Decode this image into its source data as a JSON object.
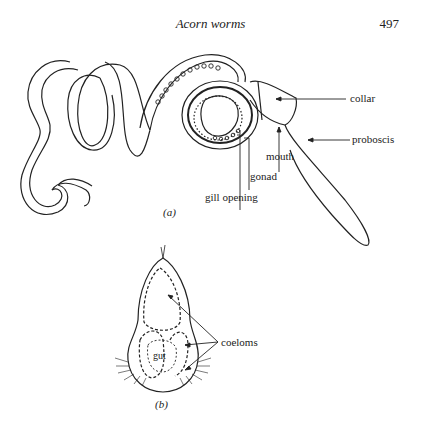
{
  "page": {
    "running_header": "Acorn worms",
    "page_number": "497"
  },
  "figure_a": {
    "caption": "(a)",
    "labels": {
      "collar": "collar",
      "proboscis": "proboscis",
      "mouth": "mouth",
      "gonad": "gonad",
      "gill_opening": "gill opening"
    }
  },
  "figure_b": {
    "caption": "(b)",
    "labels": {
      "coeloms": "coeloms",
      "gut": "gut"
    }
  }
}
